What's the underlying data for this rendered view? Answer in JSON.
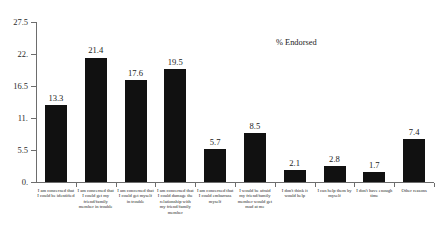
{
  "chart_data": {
    "type": "bar",
    "title": "",
    "annotation": "% Endorsed",
    "xlabel": "",
    "ylabel": "",
    "ylim": [
      0,
      27.5
    ],
    "grid": false,
    "legend": "none",
    "y_ticks": [
      "0.",
      "5.5",
      "11.",
      "16.5",
      "22.",
      "27.5"
    ],
    "y_tick_values": [
      0,
      5.5,
      11,
      16.5,
      22,
      27.5
    ],
    "categories": [
      "I am concerned that I could be identified",
      "I am concerned that I could get my friend/family member in trouble",
      "I am concerned that I could get myself in trouble",
      "I am concerned that I could damage the relationship with my friend/family member",
      "I am concerned that I could embarrass myself",
      "I would be afraid my friend/family member would get mad at me",
      "I don't think it would help",
      "I can help them by myself",
      "I don't have enough time",
      "Other reasons"
    ],
    "values": [
      13.3,
      21.4,
      17.6,
      19.5,
      5.7,
      8.5,
      2.1,
      2.8,
      1.7,
      7.4
    ],
    "value_labels": [
      "13.3",
      "21.4",
      "17.6",
      "19.5",
      "5.7",
      "8.5",
      "2.1",
      "2.8",
      "1.7",
      "7.4"
    ],
    "bar_color": "#111111",
    "axis_color": "#6d6d6d"
  }
}
